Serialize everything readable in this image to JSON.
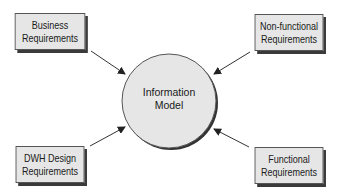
{
  "diagram": {
    "center": {
      "label_line1": "Information",
      "label_line2": "Model"
    },
    "nodes": [
      {
        "id": "business",
        "line1": "Business",
        "line2": "Requirements",
        "position": "top-left"
      },
      {
        "id": "nonfunctional",
        "line1": "Non-functional",
        "line2": "Requirements",
        "position": "top-right"
      },
      {
        "id": "dwh",
        "line1": "DWH Design",
        "line2": "Requirements",
        "position": "bottom-left"
      },
      {
        "id": "functional",
        "line1": "Functional",
        "line2": "Requirements",
        "position": "bottom-right"
      }
    ],
    "edges": [
      {
        "from": "business",
        "to": "center"
      },
      {
        "from": "nonfunctional",
        "to": "center"
      },
      {
        "from": "dwh",
        "to": "center"
      },
      {
        "from": "functional",
        "to": "center"
      }
    ],
    "colors": {
      "box_fill": "#e6e6e6",
      "circle_fill": "#e6e6e6",
      "shadow": "#3a3a3a",
      "stroke": "#333333"
    }
  }
}
